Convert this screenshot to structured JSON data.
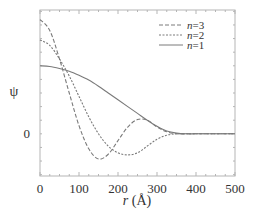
{
  "chart_data": {
    "type": "line",
    "title": "",
    "xlabel": "r (Å)",
    "xlabel_italic_part": "r",
    "xlabel_unit": " (Å)",
    "ylabel": "ψ",
    "xlim": [
      0,
      500
    ],
    "ylim": [
      -0.62,
      1.82
    ],
    "x_ticks": [
      0,
      100,
      200,
      300,
      400,
      500
    ],
    "x_tick_labels": [
      "0",
      "100",
      "200",
      "300",
      "400",
      "500"
    ],
    "y_ticks": [
      0
    ],
    "y_tick_labels": [
      "0"
    ],
    "grid": false,
    "legend_position": "upper right",
    "x": [
      0,
      25,
      50,
      75,
      100,
      125,
      150,
      175,
      200,
      225,
      250,
      275,
      300,
      325,
      350,
      375,
      400,
      450,
      500
    ],
    "series": [
      {
        "name": "n=3",
        "style": "dashed",
        "values": [
          1.68,
          1.52,
          1.1,
          0.6,
          0.12,
          -0.22,
          -0.37,
          -0.3,
          -0.1,
          0.1,
          0.21,
          0.2,
          0.1,
          0.03,
          0.0,
          0.0,
          0.0,
          0.0,
          0.0
        ]
      },
      {
        "name": "n=2",
        "style": "dotted",
        "values": [
          1.38,
          1.3,
          1.1,
          0.85,
          0.55,
          0.25,
          0.0,
          -0.18,
          -0.28,
          -0.31,
          -0.28,
          -0.18,
          -0.08,
          -0.02,
          0.0,
          0.0,
          0.0,
          0.0,
          0.0
        ]
      },
      {
        "name": "n=1",
        "style": "solid",
        "values": [
          1.0,
          0.99,
          0.96,
          0.92,
          0.86,
          0.79,
          0.7,
          0.6,
          0.5,
          0.4,
          0.3,
          0.2,
          0.11,
          0.04,
          0.01,
          0.0,
          0.0,
          0.0,
          0.0
        ]
      }
    ]
  },
  "legend": {
    "items": [
      {
        "label_italic": "n",
        "label_rest": "=3"
      },
      {
        "label_italic": "n",
        "label_rest": "=2"
      },
      {
        "label_italic": "n",
        "label_rest": "=1"
      }
    ]
  },
  "colors": {
    "curve": "#7a7a7a",
    "frame": "#b5b5b5",
    "text": "#333333"
  }
}
